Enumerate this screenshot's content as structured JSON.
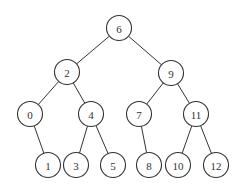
{
  "diagram": {
    "type": "binary-tree",
    "node_radius": 12.5,
    "colors": {
      "stroke": "#333333",
      "fill": "#ffffff",
      "text": "#333333",
      "background": "#ffffff"
    },
    "nodes": [
      {
        "id": "n6",
        "label": "6",
        "x": 119,
        "y": 28
      },
      {
        "id": "n2",
        "label": "2",
        "x": 67,
        "y": 72
      },
      {
        "id": "n9",
        "label": "9",
        "x": 171,
        "y": 73
      },
      {
        "id": "n0",
        "label": "0",
        "x": 30,
        "y": 114
      },
      {
        "id": "n4",
        "label": "4",
        "x": 91,
        "y": 114
      },
      {
        "id": "n7",
        "label": "7",
        "x": 139,
        "y": 114
      },
      {
        "id": "n11",
        "label": "11",
        "x": 196,
        "y": 114
      },
      {
        "id": "n1",
        "label": "1",
        "x": 48,
        "y": 165
      },
      {
        "id": "n3",
        "label": "3",
        "x": 76,
        "y": 165
      },
      {
        "id": "n5",
        "label": "5",
        "x": 113,
        "y": 165
      },
      {
        "id": "n8",
        "label": "8",
        "x": 149,
        "y": 165
      },
      {
        "id": "n10",
        "label": "10",
        "x": 178,
        "y": 165
      },
      {
        "id": "n12",
        "label": "12",
        "x": 216,
        "y": 165
      }
    ],
    "edges": [
      {
        "from": "n6",
        "to": "n2"
      },
      {
        "from": "n6",
        "to": "n9"
      },
      {
        "from": "n2",
        "to": "n0"
      },
      {
        "from": "n2",
        "to": "n4"
      },
      {
        "from": "n9",
        "to": "n7"
      },
      {
        "from": "n9",
        "to": "n11"
      },
      {
        "from": "n0",
        "to": "n1"
      },
      {
        "from": "n4",
        "to": "n3"
      },
      {
        "from": "n4",
        "to": "n5"
      },
      {
        "from": "n7",
        "to": "n8"
      },
      {
        "from": "n11",
        "to": "n10"
      },
      {
        "from": "n11",
        "to": "n12"
      }
    ]
  }
}
